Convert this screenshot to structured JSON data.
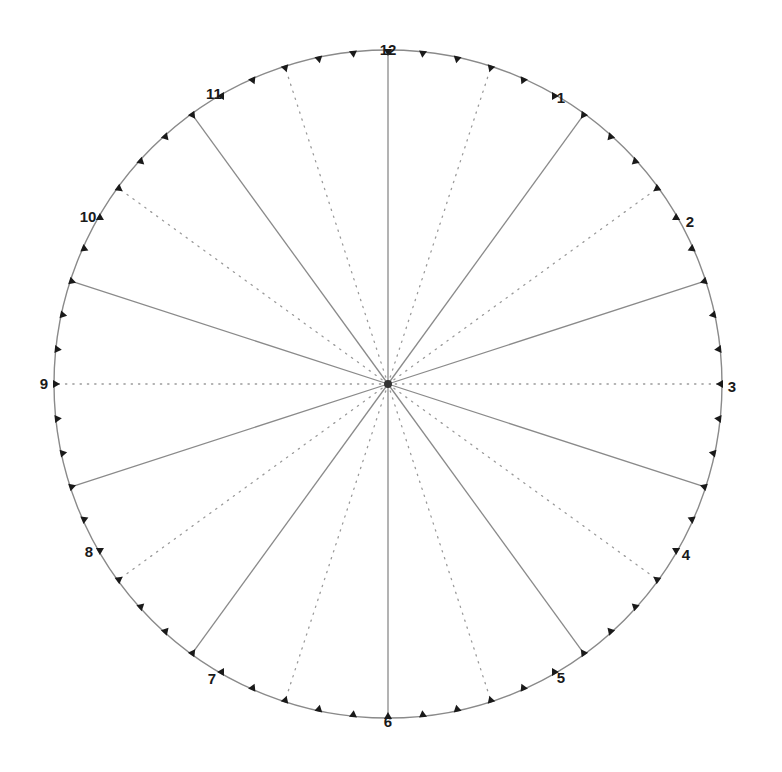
{
  "diagram": {
    "type": "clock-face-division",
    "center": [
      388,
      384
    ],
    "radius": 334,
    "circle_color": "#8a8a8a",
    "solid_line_color": "#8a8a8a",
    "dotted_line_color": "#9a9a9a",
    "tick_color": "#1a1a1a",
    "hub_color": "#333333",
    "tick_count": 60,
    "solid_line_angles_deg": [
      0,
      36,
      72,
      108,
      144,
      180,
      216,
      252,
      288,
      324
    ],
    "dotted_line_angles_deg": [
      18,
      54,
      90,
      126,
      162,
      198,
      234,
      270,
      306,
      342
    ],
    "hour_labels": [
      {
        "text": "12",
        "x": 388,
        "y": 55
      },
      {
        "text": "1",
        "x": 561,
        "y": 103
      },
      {
        "text": "2",
        "x": 690,
        "y": 227
      },
      {
        "text": "3",
        "x": 732,
        "y": 392
      },
      {
        "text": "4",
        "x": 686,
        "y": 560
      },
      {
        "text": "5",
        "x": 561,
        "y": 683
      },
      {
        "text": "6",
        "x": 388,
        "y": 727
      },
      {
        "text": "7",
        "x": 212,
        "y": 684
      },
      {
        "text": "8",
        "x": 89,
        "y": 557
      },
      {
        "text": "9",
        "x": 44,
        "y": 389
      },
      {
        "text": "10",
        "x": 88,
        "y": 222
      },
      {
        "text": "11",
        "x": 214,
        "y": 99
      }
    ]
  }
}
